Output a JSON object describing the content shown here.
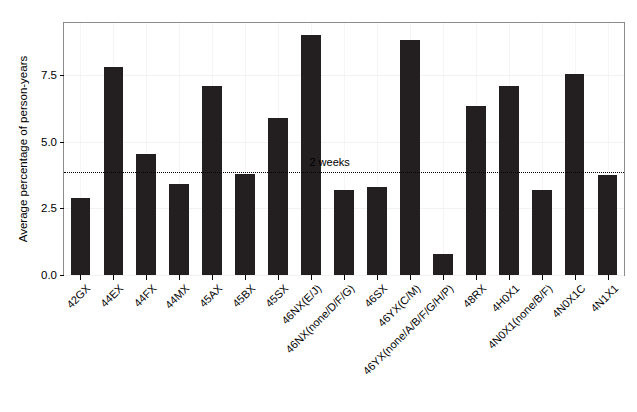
{
  "chart_data": {
    "type": "bar",
    "title": "",
    "xlabel": "",
    "ylabel": "Average percentage of person-years",
    "ylim": [
      0,
      9.45
    ],
    "yticks": [
      0.0,
      2.5,
      5.0,
      7.5
    ],
    "ytick_labels": [
      "0.0",
      "2.5",
      "5.0",
      "7.5"
    ],
    "grid": false,
    "legend": false,
    "bar_color": "#231f20",
    "categories": [
      "42GX",
      "44EX",
      "44FX",
      "44MX",
      "45AX",
      "45BX",
      "45SX",
      "46NX(E/J)",
      "46NX(none/D/F/G)",
      "46SX",
      "46YX(C/M)",
      "46YX(none/A/B/F/G/H/P)",
      "48RX",
      "4H0X1",
      "4N0X1(none/B/F)",
      "4N0X1C",
      "4N1X1"
    ],
    "values": [
      2.9,
      7.8,
      4.55,
      3.4,
      7.1,
      3.8,
      5.9,
      9.0,
      3.2,
      3.3,
      8.8,
      0.8,
      6.35,
      7.1,
      3.2,
      7.55,
      3.75
    ],
    "annotations": [
      {
        "name": "two-weeks-reference",
        "label": "2 weeks",
        "y": 3.87,
        "style": "dotted-horizontal-line"
      }
    ]
  }
}
